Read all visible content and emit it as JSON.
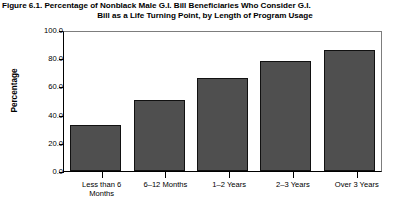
{
  "chart_data": {
    "type": "bar",
    "title": "Figure 6.1. Percentage of Nonblack Male G.I. Bill Beneficiaries Who Consider G.I. Bill as a Life Turning Point, by Length of Program Usage",
    "title_line1": "Figure 6.1. Percentage of Nonblack Male G.I. Bill Beneficiaries Who Consider G.I.",
    "title_line2": "Bill as a Life Turning Point, by Length of Program Usage",
    "xlabel": "",
    "ylabel": "Percentage",
    "categories": [
      "Less than 6\nMonths",
      "6–12 Months",
      "1–2 Years",
      "2–3 Years",
      "Over 3 Years"
    ],
    "values": [
      33.0,
      51.0,
      67.0,
      79.0,
      87.0
    ],
    "ylim": [
      0.0,
      100.0
    ],
    "ytick_labels": [
      "0.0",
      "20.0",
      "40.0",
      "60.0",
      "80.0",
      "100.0"
    ],
    "ytick_values": [
      0.0,
      20.0,
      40.0,
      60.0,
      80.0,
      100.0
    ],
    "grid": false,
    "legend": false,
    "bar_color": "#4f4f4f",
    "bar_edge_color": "#111111",
    "frame_color": "#000000",
    "background_color": "#ffffff"
  }
}
